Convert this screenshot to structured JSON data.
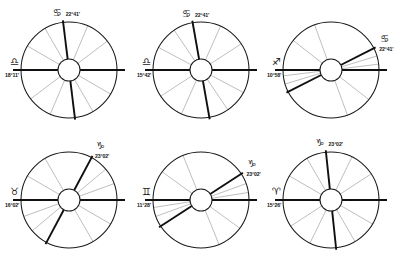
{
  "figure": {
    "title": "",
    "background_color": "#ffffff",
    "rows": 2,
    "columns": 3,
    "width": 398,
    "height": 260
  },
  "style": {
    "rim_color": "#1a1a1a",
    "hub_color": "#ffffff",
    "minor_cusp_color": "#9a9a9a",
    "major_cusp_color": "#101010",
    "text_color": "#161616"
  },
  "glyphs": {
    "aries": "♈",
    "taurus": "♉",
    "gemini": "♊",
    "cancer": "♋",
    "libra": "♎",
    "sagittarius": "♐",
    "capricorn": "♑"
  },
  "charts": [
    {
      "id": "chart-1",
      "position": "top-left",
      "mc": {
        "sign": "cancer",
        "glyph": "♋",
        "degree_label": "22°41'",
        "label_anchor": "top"
      },
      "asc": {
        "sign": "libra",
        "glyph": "♎",
        "degree_label": "18°11'",
        "label_anchor": "left"
      },
      "cusp_angles": [
        180,
        150,
        120,
        97,
        67,
        37,
        0,
        330,
        300,
        277,
        247,
        217
      ],
      "major_cusps": [
        180,
        0,
        97,
        277
      ],
      "house_system": "equal-like"
    },
    {
      "id": "chart-2",
      "position": "top-center",
      "mc": {
        "sign": "cancer",
        "glyph": "♋",
        "degree_label": "22°41'",
        "label_anchor": "top"
      },
      "asc": {
        "sign": "libra",
        "glyph": "♎",
        "degree_label": "15°42'",
        "label_anchor": "left"
      },
      "cusp_angles": [
        180,
        152,
        124,
        100,
        66,
        33,
        0,
        332,
        304,
        280,
        246,
        213
      ],
      "major_cusps": [
        180,
        0,
        100,
        280
      ],
      "house_system": "equal-like"
    },
    {
      "id": "chart-3",
      "position": "top-right",
      "mc": {
        "sign": "cancer",
        "glyph": "♋",
        "degree_label": "22°41'",
        "label_anchor": "upper-right"
      },
      "asc": {
        "sign": "sagittarius",
        "glyph": "♐",
        "degree_label": "10°58'",
        "label_anchor": "left"
      },
      "cusp_angles": [
        180,
        142,
        110,
        27,
        17,
        7,
        0,
        322,
        290,
        207,
        197,
        187
      ],
      "major_cusps": [
        180,
        0,
        27,
        207
      ],
      "house_system": "clustered"
    },
    {
      "id": "chart-4",
      "position": "bottom-left",
      "mc": {
        "sign": "capricorn",
        "glyph": "♑",
        "degree_label": "23°02'",
        "label_anchor": "upper-right"
      },
      "asc": {
        "sign": "taurus",
        "glyph": "♉",
        "degree_label": "16°02'",
        "label_anchor": "left"
      },
      "cusp_angles": [
        180,
        150,
        120,
        62,
        40,
        20,
        0,
        330,
        300,
        242,
        220,
        200
      ],
      "major_cusps": [
        180,
        0,
        62,
        242
      ],
      "house_system": "clustered"
    },
    {
      "id": "chart-5",
      "position": "bottom-center",
      "mc": {
        "sign": "capricorn",
        "glyph": "♑",
        "degree_label": "23°02'",
        "label_anchor": "upper-right"
      },
      "asc": {
        "sign": "gemini",
        "glyph": "♊",
        "degree_label": "11°28'",
        "label_anchor": "left"
      },
      "cusp_angles": [
        180,
        144,
        112,
        33,
        20,
        9,
        0,
        324,
        292,
        213,
        200,
        189
      ],
      "major_cusps": [
        180,
        0,
        33,
        213
      ],
      "house_system": "clustered"
    },
    {
      "id": "chart-6",
      "position": "bottom-right",
      "mc": {
        "sign": "capricorn",
        "glyph": "♑",
        "degree_label": "23°02'",
        "label_anchor": "top"
      },
      "asc": {
        "sign": "aries",
        "glyph": "♈",
        "degree_label": "15°26'",
        "label_anchor": "left"
      },
      "cusp_angles": [
        180,
        150,
        120,
        96,
        64,
        33,
        0,
        330,
        300,
        276,
        244,
        213
      ],
      "major_cusps": [
        180,
        0,
        96,
        276
      ],
      "house_system": "equal-like"
    }
  ],
  "chart_data": {
    "type": "scatter",
    "title": "",
    "subtitle": "",
    "xlabel": "",
    "ylabel": "",
    "series": [
      {
        "name": "chart-1",
        "mc_label": "♋ 22°41'",
        "asc_label": "♎ 18°11'",
        "values": [
          180,
          150,
          120,
          97,
          67,
          37,
          0,
          330,
          300,
          277,
          247,
          217
        ]
      },
      {
        "name": "chart-2",
        "mc_label": "♋ 22°41'",
        "asc_label": "♎ 15°42'",
        "values": [
          180,
          152,
          124,
          100,
          66,
          33,
          0,
          332,
          304,
          280,
          246,
          213
        ]
      },
      {
        "name": "chart-3",
        "mc_label": "♋ 22°41'",
        "asc_label": "♐ 10°58'",
        "values": [
          180,
          142,
          110,
          27,
          17,
          7,
          0,
          322,
          290,
          207,
          197,
          187
        ]
      },
      {
        "name": "chart-4",
        "mc_label": "♑ 23°02'",
        "asc_label": "♉ 16°02'",
        "values": [
          180,
          150,
          120,
          62,
          40,
          20,
          0,
          330,
          300,
          242,
          220,
          200
        ]
      },
      {
        "name": "chart-5",
        "mc_label": "♑ 23°02'",
        "asc_label": "♊ 11°28'",
        "values": [
          180,
          144,
          112,
          33,
          20,
          9,
          0,
          324,
          292,
          213,
          200,
          189
        ]
      },
      {
        "name": "chart-6",
        "mc_label": "♑ 23°02'",
        "asc_label": "♈ 15°26'",
        "values": [
          180,
          150,
          120,
          96,
          64,
          33,
          0,
          330,
          300,
          276,
          244,
          213
        ]
      }
    ],
    "legend_position": "none",
    "grid": false
  }
}
